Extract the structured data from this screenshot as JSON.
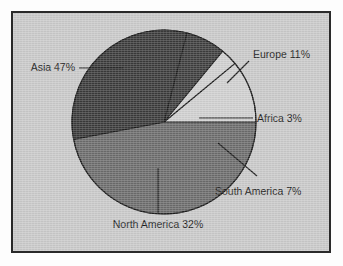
{
  "figure": {
    "background_color": "#fdfdfd",
    "plate_color": "#c9c9c9",
    "border_color": "#2a2a2a"
  },
  "chart_data": {
    "type": "pie",
    "title": "",
    "subtitle": "",
    "xlabel": "",
    "ylabel": "",
    "grid": false,
    "legend_position": "none",
    "labels_inline": true,
    "units": "percent",
    "total": 100,
    "categories": [
      "Asia",
      "Europe",
      "Africa",
      "South America",
      "North America"
    ],
    "values": [
      47,
      11,
      3,
      7,
      32
    ],
    "slices": [
      {
        "name": "Asia",
        "value": 47,
        "label": "Asia 47%",
        "color": "#6b6b6b",
        "start_angle_deg": 190.8,
        "sweep_deg": 169.2,
        "label_side": "left"
      },
      {
        "name": "Europe",
        "value": 11,
        "label": "Europe 11%",
        "color": "#cfcfcf",
        "start_angle_deg": 0,
        "sweep_deg": 39.6,
        "label_side": "right"
      },
      {
        "name": "Africa",
        "value": 3,
        "label": "Africa 3%",
        "color": "#cfcfcf",
        "start_angle_deg": 39.6,
        "sweep_deg": 10.8,
        "label_side": "right"
      },
      {
        "name": "South America",
        "value": 7,
        "label": "South America 7%",
        "color": "#3d3d3d",
        "start_angle_deg": 50.4,
        "sweep_deg": 25.2,
        "label_side": "right"
      },
      {
        "name": "North America",
        "value": 32,
        "label": "North America 32%",
        "color": "#3a3a3a",
        "start_angle_deg": 75.6,
        "sweep_deg": 115.2,
        "label_side": "bottom"
      }
    ]
  },
  "labels": {
    "asia": "Asia 47%",
    "europe": "Europe 11%",
    "africa": "Africa 3%",
    "south_america": "South America 7%",
    "north_america": "North America 32%"
  }
}
